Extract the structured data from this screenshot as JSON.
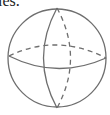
{
  "caption": "les.",
  "figure": {
    "type": "sphere-wireframe",
    "elements": [
      "outline",
      "equator-front",
      "equator-back-dashed",
      "meridian-front",
      "meridian-back-dashed"
    ],
    "stroke_color": "#6e6e6e"
  }
}
